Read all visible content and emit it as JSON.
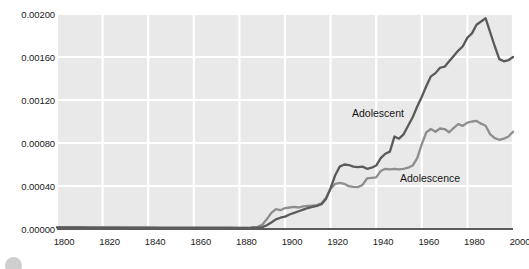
{
  "chart_data": {
    "type": "line",
    "title": "",
    "xlabel": "",
    "ylabel": "",
    "xlim": [
      1800,
      2000
    ],
    "ylim": [
      0.0,
      0.002
    ],
    "grid": true,
    "legend_position": "inline-annotation",
    "x_ticks": [
      "1800",
      "1820",
      "1840",
      "1860",
      "1880",
      "1900",
      "1920",
      "1940",
      "1960",
      "1980",
      "2000"
    ],
    "x_tick_values": [
      1800,
      1820,
      1840,
      1860,
      1880,
      1900,
      1920,
      1940,
      1960,
      1980,
      2000
    ],
    "y_ticks": [
      "0.00000",
      "0.00040",
      "0.00080",
      "0.00120",
      "0.00160",
      "0.00200"
    ],
    "y_tick_values": [
      0.0,
      0.0004,
      0.0008,
      0.0012,
      0.0016,
      0.002
    ],
    "colors": {
      "plot_background": "#e9e9e9",
      "gridline": "#ffffff",
      "axis_line": "#5c5c5c",
      "adolescent": "#5a5a5a",
      "adolescence": "#8e8e8e",
      "text": "#1b1b1b"
    },
    "series": [
      {
        "name": "Adolescent",
        "color": "#5a5a5a",
        "x": [
          1800,
          1805,
          1810,
          1815,
          1820,
          1825,
          1830,
          1835,
          1840,
          1845,
          1850,
          1855,
          1860,
          1865,
          1870,
          1875,
          1880,
          1885,
          1888,
          1890,
          1892,
          1894,
          1896,
          1898,
          1900,
          1902,
          1904,
          1906,
          1908,
          1910,
          1912,
          1914,
          1916,
          1918,
          1920,
          1922,
          1924,
          1926,
          1928,
          1930,
          1932,
          1934,
          1936,
          1938,
          1940,
          1942,
          1944,
          1946,
          1948,
          1950,
          1952,
          1954,
          1956,
          1958,
          1960,
          1962,
          1964,
          1966,
          1968,
          1970,
          1972,
          1974,
          1976,
          1978,
          1980,
          1982,
          1984,
          1986,
          1988,
          1990,
          1992,
          1994,
          1996,
          1998,
          2000
        ],
        "y": [
          1.5e-05,
          1.4e-05,
          1.4e-05,
          1.3e-05,
          1.3e-05,
          1.3e-05,
          1.2e-05,
          1.2e-05,
          1.2e-05,
          1.1e-05,
          1.1e-05,
          1.1e-05,
          1.1e-05,
          1e-05,
          1e-05,
          1e-05,
          9e-06,
          1e-05,
          1.2e-05,
          1.8e-05,
          3.5e-05,
          6e-05,
          9e-05,
          0.000105,
          0.000115,
          0.000135,
          0.00015,
          0.000165,
          0.00018,
          0.000195,
          0.000205,
          0.000215,
          0.00023,
          0.00028,
          0.00038,
          0.0005,
          0.00058,
          0.0006,
          0.000595,
          0.00058,
          0.000575,
          0.00058,
          0.00056,
          0.00057,
          0.00059,
          0.00066,
          0.0007,
          0.00072,
          0.00086,
          0.00084,
          0.00088,
          0.00096,
          0.00104,
          0.00114,
          0.00123,
          0.00133,
          0.00142,
          0.00145,
          0.0015,
          0.00151,
          0.00156,
          0.00161,
          0.00166,
          0.0017,
          0.00178,
          0.00182,
          0.0019,
          0.00193,
          0.00196,
          0.00183,
          0.0017,
          0.00158,
          0.00156,
          0.00157,
          0.0016
        ]
      },
      {
        "name": "Adolescence",
        "color": "#8e8e8e",
        "x": [
          1800,
          1805,
          1810,
          1815,
          1820,
          1825,
          1830,
          1835,
          1840,
          1845,
          1850,
          1855,
          1860,
          1865,
          1870,
          1875,
          1880,
          1885,
          1888,
          1890,
          1892,
          1894,
          1896,
          1898,
          1900,
          1902,
          1904,
          1906,
          1908,
          1910,
          1912,
          1914,
          1916,
          1918,
          1920,
          1922,
          1924,
          1926,
          1928,
          1930,
          1932,
          1934,
          1936,
          1938,
          1940,
          1942,
          1944,
          1946,
          1948,
          1950,
          1952,
          1954,
          1956,
          1958,
          1960,
          1962,
          1964,
          1966,
          1968,
          1970,
          1972,
          1974,
          1976,
          1978,
          1980,
          1982,
          1984,
          1986,
          1988,
          1990,
          1992,
          1994,
          1996,
          1998,
          2000
        ],
        "y": [
          1.6e-05,
          1.5e-05,
          1.5e-05,
          1.4e-05,
          1.4e-05,
          1.4e-05,
          1.3e-05,
          1.3e-05,
          1.3e-05,
          1.3e-05,
          1.3e-05,
          1.3e-05,
          1.3e-05,
          1.2e-05,
          1.2e-05,
          1.2e-05,
          1.2e-05,
          1.4e-05,
          2e-05,
          4e-05,
          9e-05,
          0.00015,
          0.000185,
          0.000175,
          0.000195,
          0.0002,
          0.000205,
          0.0002,
          0.00021,
          0.000215,
          0.000218,
          0.000222,
          0.00024,
          0.00029,
          0.000375,
          0.00042,
          0.00043,
          0.00042,
          0.000398,
          0.000392,
          0.00039,
          0.00041,
          0.00047,
          0.000475,
          0.00048,
          0.00054,
          0.00056,
          0.000555,
          0.00056,
          0.000555,
          0.00056,
          0.00057,
          0.00059,
          0.00066,
          0.00079,
          0.0009,
          0.00093,
          0.000905,
          0.000935,
          0.00093,
          0.0009,
          0.00094,
          0.000975,
          0.00096,
          0.00099,
          0.001,
          0.001005,
          0.00098,
          0.00096,
          0.00088,
          0.000845,
          0.00083,
          0.00084,
          0.00086,
          0.000905
        ]
      }
    ],
    "annotations": [
      {
        "text": "Adolescent",
        "series": "Adolescent"
      },
      {
        "text": "Adolescence",
        "series": "Adolescence"
      }
    ]
  }
}
